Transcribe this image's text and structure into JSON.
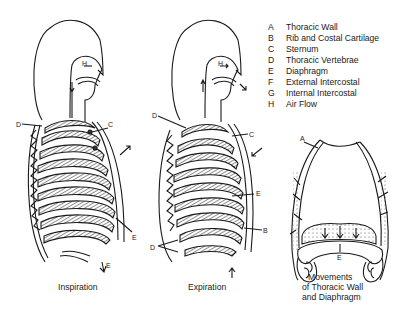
{
  "legend": {
    "items": [
      {
        "key": "A",
        "label": "Thoracic Wall"
      },
      {
        "key": "B",
        "label": "Rib and Costal Cartilage"
      },
      {
        "key": "C",
        "label": "Sternum"
      },
      {
        "key": "D",
        "label": "Thoracic Vertebrae"
      },
      {
        "key": "E",
        "label": "Diaphragm"
      },
      {
        "key": "F",
        "label": "External Intercostal"
      },
      {
        "key": "G",
        "label": "Internal Intercostal"
      },
      {
        "key": "H",
        "label": "Air Flow"
      }
    ]
  },
  "figures": {
    "inspiration": {
      "caption": "Inspiration",
      "labels": {
        "d": "D",
        "c": "C",
        "g": "G",
        "e": "E",
        "h": "H",
        "f_bottom": "E"
      }
    },
    "expiration": {
      "caption": "Expiration",
      "labels": {
        "d_top": "D",
        "c": "C",
        "b_mid": "B",
        "e": "E",
        "b": "B",
        "d_bottom": "D",
        "h": "H"
      }
    },
    "movements": {
      "caption_line1": "Movements",
      "caption_line2": "of Thoracic Wall",
      "caption_line3": "and Diaphragm",
      "labels": {
        "a": "A",
        "e": "E"
      }
    }
  },
  "colors": {
    "ink": "#1a1a1a",
    "background": "#ffffff"
  }
}
